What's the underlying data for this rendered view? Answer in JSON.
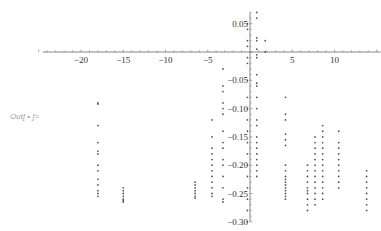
{
  "out_label": "Out[ • ]=",
  "colors": {
    "axis": "#555555",
    "point": "#555555",
    "label": "#333333"
  },
  "chart_data": {
    "type": "scatter",
    "title": "",
    "xlabel": "",
    "ylabel": "",
    "xlim": [
      -25,
      15
    ],
    "ylim": [
      -0.3,
      0.07
    ],
    "grid": false,
    "legend": null,
    "x_ticks": [
      -20,
      -15,
      -10,
      -5,
      5,
      10
    ],
    "x_tick_labels": [
      "−20",
      "−15",
      "−10",
      "−5",
      "5",
      "10"
    ],
    "y_ticks": [
      0.05,
      -0.05,
      -0.1,
      -0.15,
      -0.2,
      -0.25,
      -0.3
    ],
    "y_tick_labels": [
      "0.05",
      "−0.05",
      "−0.10",
      "−0.15",
      "−0.20",
      "−0.25",
      "−0.30"
    ],
    "columns": [
      {
        "x": -18,
        "y": [
          -0.09,
          -0.092,
          -0.13,
          -0.16,
          -0.175,
          -0.18,
          -0.2,
          -0.21,
          -0.225,
          -0.235,
          -0.245,
          -0.25,
          -0.255
        ]
      },
      {
        "x": -15,
        "y": [
          -0.24,
          -0.245,
          -0.25,
          -0.255,
          -0.26,
          -0.262,
          -0.265
        ]
      },
      {
        "x": -6.5,
        "y": [
          -0.23,
          -0.235,
          -0.24,
          -0.245,
          -0.25,
          -0.255,
          -0.258
        ]
      },
      {
        "x": -4.5,
        "y": [
          -0.12,
          -0.15,
          -0.17,
          -0.18,
          -0.19,
          -0.2,
          -0.21,
          -0.22,
          -0.23,
          -0.24,
          -0.25,
          -0.255
        ]
      },
      {
        "x": -3.2,
        "y": [
          -0.03,
          -0.06,
          -0.07,
          -0.09,
          -0.1,
          -0.11,
          -0.14,
          -0.16,
          -0.17,
          -0.19,
          -0.2,
          -0.22,
          -0.24,
          -0.26,
          -0.265
        ]
      },
      {
        "x": -0.3,
        "y": [
          0.05,
          0.04,
          0.02,
          0.01,
          -0.01,
          -0.02,
          -0.05,
          -0.08,
          -0.1,
          -0.12,
          -0.14,
          -0.16,
          -0.18,
          -0.2,
          -0.22,
          -0.24,
          -0.26,
          -0.28,
          -0.3
        ]
      },
      {
        "x": 0.8,
        "y": [
          0.07,
          0.06,
          0.025,
          0.02,
          0.005,
          -0.005,
          -0.01,
          -0.04,
          -0.055,
          -0.06,
          -0.08,
          -0.1,
          -0.12,
          -0.13,
          -0.15,
          -0.16,
          -0.17,
          -0.18,
          -0.19,
          -0.2,
          -0.21,
          -0.22
        ]
      },
      {
        "x": 1.8,
        "y": [
          0.02,
          0.0
        ]
      },
      {
        "x": 4.2,
        "y": [
          -0.08,
          -0.11,
          -0.12,
          -0.145,
          -0.155,
          -0.165,
          -0.2,
          -0.21,
          -0.22,
          -0.225,
          -0.23,
          -0.235,
          -0.24,
          -0.245,
          -0.25,
          -0.255,
          -0.26
        ]
      },
      {
        "x": 6.8,
        "y": [
          -0.2,
          -0.21,
          -0.22,
          -0.23,
          -0.24,
          -0.245,
          -0.25,
          -0.26,
          -0.27,
          -0.28
        ]
      },
      {
        "x": 7.7,
        "y": [
          -0.15,
          -0.16,
          -0.17,
          -0.18,
          -0.19,
          -0.2,
          -0.21,
          -0.22,
          -0.23,
          -0.24,
          -0.25,
          -0.26,
          -0.27
        ]
      },
      {
        "x": 8.6,
        "y": [
          -0.13,
          -0.14,
          -0.15,
          -0.16,
          -0.17,
          -0.18,
          -0.19,
          -0.2,
          -0.21,
          -0.22,
          -0.23,
          -0.24,
          -0.25,
          -0.26
        ]
      },
      {
        "x": 10.5,
        "y": [
          -0.14,
          -0.16,
          -0.17,
          -0.18,
          -0.19,
          -0.2,
          -0.21,
          -0.22,
          -0.23,
          -0.24
        ]
      },
      {
        "x": 13.8,
        "y": [
          -0.21,
          -0.22,
          -0.23,
          -0.24,
          -0.25,
          -0.26,
          -0.27,
          -0.28
        ]
      }
    ]
  }
}
